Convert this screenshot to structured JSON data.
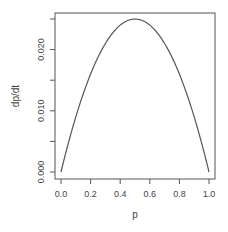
{
  "chart_data": {
    "type": "line",
    "title": "",
    "xlabel": "p",
    "ylabel": "dp/dt",
    "xlim": [
      0.0,
      1.0
    ],
    "ylim": [
      0.0,
      0.025
    ],
    "x_ticks": [
      "0.0",
      "0.2",
      "0.4",
      "0.6",
      "0.8",
      "1.0"
    ],
    "y_ticks": [
      "0.000",
      "0.010",
      "0.020"
    ],
    "y_minor_ticks": [
      0.005,
      0.015,
      0.025
    ],
    "grid": false,
    "legend": null,
    "series": [
      {
        "name": "dp/dt = 0.1 p (1 - p)",
        "x": [
          0.0,
          0.1,
          0.2,
          0.3,
          0.4,
          0.5,
          0.6,
          0.7,
          0.8,
          0.9,
          1.0
        ],
        "values": [
          0.0,
          0.009,
          0.016,
          0.021,
          0.024,
          0.025,
          0.024,
          0.021,
          0.016,
          0.009,
          0.0
        ]
      }
    ],
    "line_color": "#555555"
  }
}
